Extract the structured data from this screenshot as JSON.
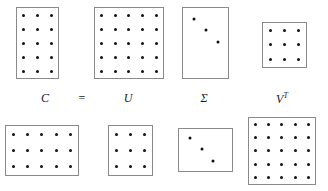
{
  "figure": {
    "background_color": "#ffffff",
    "border_color": "#8a8a8a",
    "dot_color": "#111111"
  },
  "equation": {
    "labels": [
      {
        "id": "C",
        "text": "C",
        "sup": "",
        "x": 45,
        "y": 92
      },
      {
        "id": "eq",
        "text": "=",
        "sup": "",
        "x": 82,
        "y": 92
      },
      {
        "id": "U",
        "text": "U",
        "sup": "",
        "x": 128,
        "y": 92
      },
      {
        "id": "S",
        "text": "Σ",
        "sup": "",
        "x": 204,
        "y": 92
      },
      {
        "id": "VT",
        "text": "V",
        "sup": "T",
        "x": 282,
        "y": 92
      }
    ]
  },
  "matrices": {
    "top": [
      {
        "name": "matrix-c",
        "label": "C",
        "rows": 5,
        "cols": 3,
        "fill": "full",
        "x": 16,
        "y": 7,
        "width": 43,
        "height": 72
      },
      {
        "name": "matrix-u",
        "label": "U",
        "rows": 5,
        "cols": 5,
        "fill": "full",
        "x": 94,
        "y": 7,
        "width": 70,
        "height": 72
      },
      {
        "name": "matrix-sigma",
        "label": "Σ",
        "rows": 5,
        "cols": 3,
        "fill": "diagonal",
        "diagonal_count": 3,
        "x": 182,
        "y": 7,
        "width": 47,
        "height": 72
      },
      {
        "name": "matrix-v-transpose",
        "label": "V^T",
        "rows": 3,
        "cols": 3,
        "fill": "full",
        "x": 262,
        "y": 22,
        "width": 45,
        "height": 46
      }
    ],
    "bottom": [
      {
        "name": "matrix-c-wide",
        "rows": 3,
        "cols": 5,
        "fill": "full",
        "x": 5,
        "y": 125,
        "width": 74,
        "height": 51
      },
      {
        "name": "matrix-u-small",
        "rows": 3,
        "cols": 3,
        "fill": "full",
        "x": 108,
        "y": 125,
        "width": 45,
        "height": 51
      },
      {
        "name": "matrix-sigma-wide",
        "rows": 3,
        "cols": 5,
        "fill": "diagonal",
        "diagonal_count": 3,
        "x": 178,
        "y": 128,
        "width": 55,
        "height": 44
      },
      {
        "name": "matrix-v-transpose-large",
        "rows": 5,
        "cols": 5,
        "fill": "full",
        "x": 248,
        "y": 117,
        "width": 68,
        "height": 68
      }
    ]
  }
}
